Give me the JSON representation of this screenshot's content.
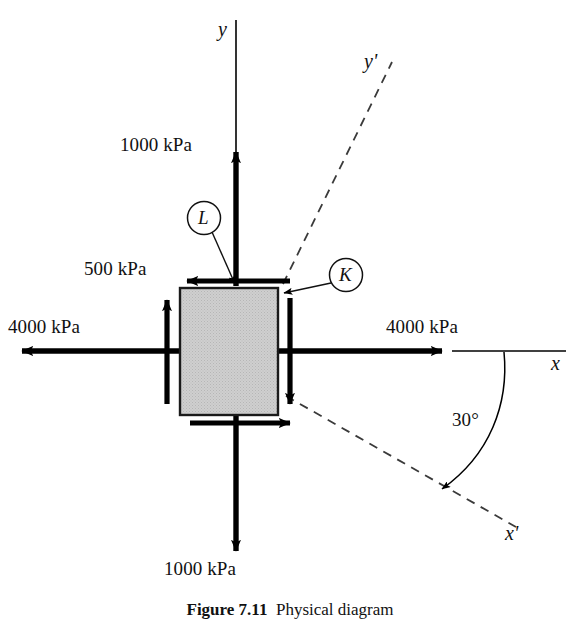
{
  "figure": {
    "caption_bold": "Figure 7.11",
    "caption_rest": "Physical diagram",
    "caption_full": "Figure 7.11  Physical diagram"
  },
  "axes": {
    "y_label": "y",
    "x_label": "x",
    "y_prime_label": "y'",
    "x_prime_label": "x'",
    "angle_label": "30°",
    "angle_value": 30,
    "angle_from": "x",
    "angle_to": "x'",
    "rotation_sense": "clockwise"
  },
  "stresses": {
    "normal_x_label": "4000 kPa",
    "normal_x_left_label": "4000 kPa",
    "normal_x_right_label": "4000 kPa",
    "normal_y_top_label": "1000 kPa",
    "normal_y_bottom_label": "1000 kPa",
    "shear_label": "500 kPa",
    "sigma_x": 4000,
    "sigma_y": 1000,
    "tau_xy": 500,
    "units": "kPa"
  },
  "callouts": [
    {
      "id": "K",
      "label": "K",
      "face": "right"
    },
    {
      "id": "L",
      "label": "L",
      "face": "top"
    }
  ],
  "colors": {
    "element_fill": "#c9c9c9",
    "element_stroke": "#1a1a1a",
    "arrow": "#000000",
    "axis": "#000000",
    "dashed_axis": "#333333"
  }
}
